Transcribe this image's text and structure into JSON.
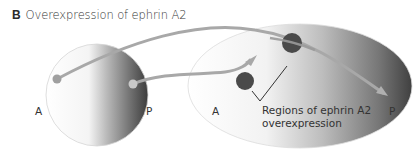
{
  "figure": {
    "panel_label": "B",
    "title": "Overexpression of ephrin A2"
  },
  "retina": {
    "anterior_label": "A",
    "posterior_label": "P"
  },
  "tectum": {
    "anterior_label": "A",
    "posterior_label": "P"
  },
  "annotation": {
    "line1": "Regions of ephrin A2",
    "line2": "overexpression"
  },
  "colors": {
    "sphere_light": "#ffffff",
    "sphere_dark": "#3a3a3a",
    "axon": "#a8a8a8",
    "overexpression_dot": "#4a4a4a",
    "text": "#333333"
  }
}
